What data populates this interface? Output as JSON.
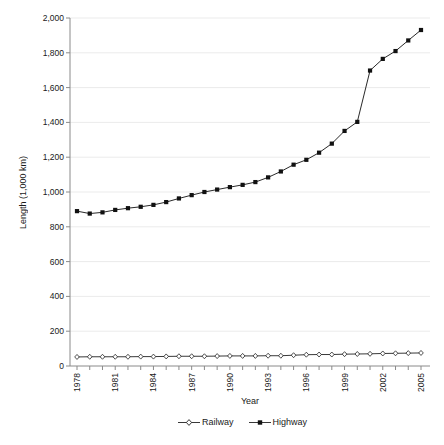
{
  "chart_data": {
    "type": "line",
    "title": "",
    "xlabel": "Year",
    "ylabel": "Length (1,000 km)",
    "x": [
      1978,
      1979,
      1980,
      1981,
      1982,
      1983,
      1984,
      1985,
      1986,
      1987,
      1988,
      1989,
      1990,
      1991,
      1992,
      1993,
      1994,
      1995,
      1996,
      1997,
      1998,
      1999,
      2000,
      2001,
      2002,
      2003,
      2004,
      2005
    ],
    "x_tick_label_years": [
      1978,
      1981,
      1984,
      1987,
      1990,
      1993,
      1996,
      1999,
      2002,
      2005
    ],
    "ylim": [
      0,
      2000
    ],
    "y_tick_interval": 200,
    "y_tick_labels": [
      "0",
      "200",
      "400",
      "600",
      "800",
      "1,000",
      "1,200",
      "1,400",
      "1,600",
      "1,800",
      "2,000"
    ],
    "grid": "horizontal",
    "legend_position": "bottom-center",
    "series": [
      {
        "name": "Railway",
        "marker": "open-diamond",
        "color": "#222222",
        "values": [
          52,
          53,
          53,
          53,
          53,
          54,
          54,
          55,
          56,
          56,
          56,
          57,
          58,
          58,
          58,
          59,
          59,
          62,
          65,
          66,
          66,
          68,
          69,
          70,
          72,
          73,
          74,
          75
        ]
      },
      {
        "name": "Highway",
        "marker": "filled-square",
        "color": "#111111",
        "values": [
          890,
          876,
          883,
          897,
          907,
          915,
          926,
          942,
          963,
          982,
          1000,
          1014,
          1028,
          1041,
          1057,
          1084,
          1118,
          1157,
          1185,
          1226,
          1278,
          1351,
          1403,
          1698,
          1765,
          1810,
          1871,
          1931
        ]
      }
    ]
  },
  "colors": {
    "background": "#ffffff",
    "grid": "#ebebeb",
    "axis": "#8a8a8a",
    "text": "#1a1a1a",
    "series_line": "#222222"
  }
}
